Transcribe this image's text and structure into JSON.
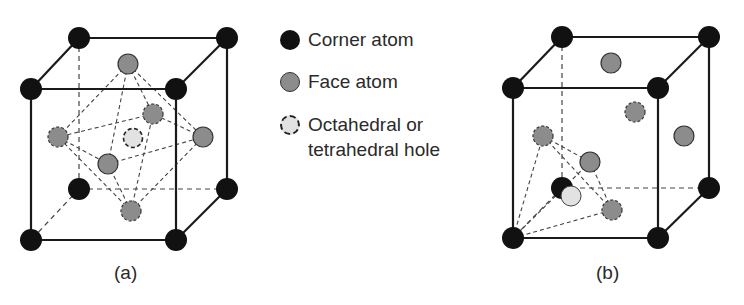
{
  "legend": {
    "items": [
      {
        "label": "Corner atom",
        "icon": "corner-atom-icon",
        "color": "#111111"
      },
      {
        "label": "Face atom",
        "icon": "face-atom-icon",
        "color": "#8c8c8c"
      },
      {
        "label_line1": "Octahedral or",
        "label_line2": "tetrahedral hole",
        "icon": "hole-icon",
        "color": "#e2e2e2"
      }
    ]
  },
  "figures": [
    {
      "caption": "(a)",
      "description": "FCC unit cell with octahedral hole at cube center surrounded by six face atoms"
    },
    {
      "caption": "(b)",
      "description": "FCC unit cell with tetrahedral hole formed by one corner atom and three adjacent face atoms"
    }
  ],
  "colors": {
    "corner": "#111111",
    "face": "#8c8c8c",
    "hole": "#e2e2e2",
    "line": "#1a1a1a"
  }
}
